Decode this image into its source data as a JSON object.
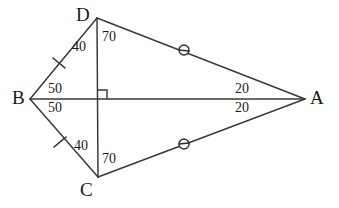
{
  "figure": {
    "background_color": "#ffffff",
    "line_color": "#3a3a3a",
    "text_color": "#1a1a1a",
    "width": 339,
    "height": 208
  },
  "vertices": [
    {
      "id": "D",
      "label": "D",
      "x": 97,
      "y": 18,
      "label_x": 76,
      "label_y": 5
    },
    {
      "id": "B",
      "label": "B",
      "x": 30,
      "y": 99,
      "label_x": 12,
      "label_y": 88
    },
    {
      "id": "C",
      "label": "C",
      "x": 98,
      "y": 177,
      "label_x": 80,
      "label_y": 180
    },
    {
      "id": "A",
      "label": "A",
      "x": 305,
      "y": 99,
      "label_x": 310,
      "label_y": 88
    }
  ],
  "edges": [
    {
      "id": "BD",
      "from": "B",
      "to": "D",
      "mark": "single-tick"
    },
    {
      "id": "DA",
      "from": "D",
      "to": "A",
      "mark": "circle"
    },
    {
      "id": "AC",
      "from": "A",
      "to": "C",
      "mark": "circle"
    },
    {
      "id": "CB",
      "from": "C",
      "to": "B",
      "mark": "single-tick"
    }
  ],
  "diagonals": [
    {
      "id": "BA",
      "from": "B",
      "to": "A",
      "orientation": "horizontal"
    },
    {
      "id": "DC",
      "from": "D",
      "to": "C",
      "orientation": "vertical"
    }
  ],
  "intersection": {
    "id": "E",
    "x": 98,
    "y": 99,
    "right_angle": true,
    "right_angle_size": 9,
    "right_angle_opens": "upper-right"
  },
  "angle_labels": [
    {
      "id": "angle-BDC",
      "vertex": "D",
      "value": "40",
      "x": 72,
      "y": 40,
      "side": "left"
    },
    {
      "id": "angle-CDA",
      "vertex": "D",
      "value": "70",
      "x": 102,
      "y": 30,
      "side": "right"
    },
    {
      "id": "angle-DBA",
      "vertex": "B",
      "value": "50",
      "x": 48,
      "y": 82,
      "side": "upper"
    },
    {
      "id": "angle-ABC",
      "vertex": "B",
      "value": "50",
      "x": 48,
      "y": 101,
      "side": "lower"
    },
    {
      "id": "angle-DAB",
      "vertex": "A",
      "value": "20",
      "x": 235,
      "y": 82,
      "side": "upper"
    },
    {
      "id": "angle-BAC",
      "vertex": "A",
      "value": "20",
      "x": 235,
      "y": 101,
      "side": "lower"
    },
    {
      "id": "angle-BCD",
      "vertex": "C",
      "value": "40",
      "x": 74,
      "y": 139,
      "side": "left"
    },
    {
      "id": "angle-DCA",
      "vertex": "C",
      "value": "70",
      "x": 102,
      "y": 152,
      "side": "right"
    }
  ],
  "congruence_marks": {
    "tick_marks": [
      {
        "id": "tick-BD",
        "on_edge": "BD",
        "x": 59,
        "y": 63,
        "symbol": "single-slash"
      },
      {
        "id": "tick-BC",
        "on_edge": "CB",
        "x": 60,
        "y": 142,
        "symbol": "single-slash"
      }
    ],
    "circle_marks": [
      {
        "id": "circle-DA",
        "on_edge": "DA",
        "x": 184,
        "y": 50,
        "radius": 5,
        "symbol": "circle-with-bar"
      },
      {
        "id": "circle-CA",
        "on_edge": "AC",
        "x": 184,
        "y": 144,
        "radius": 5,
        "symbol": "circle-with-bar"
      }
    ]
  }
}
